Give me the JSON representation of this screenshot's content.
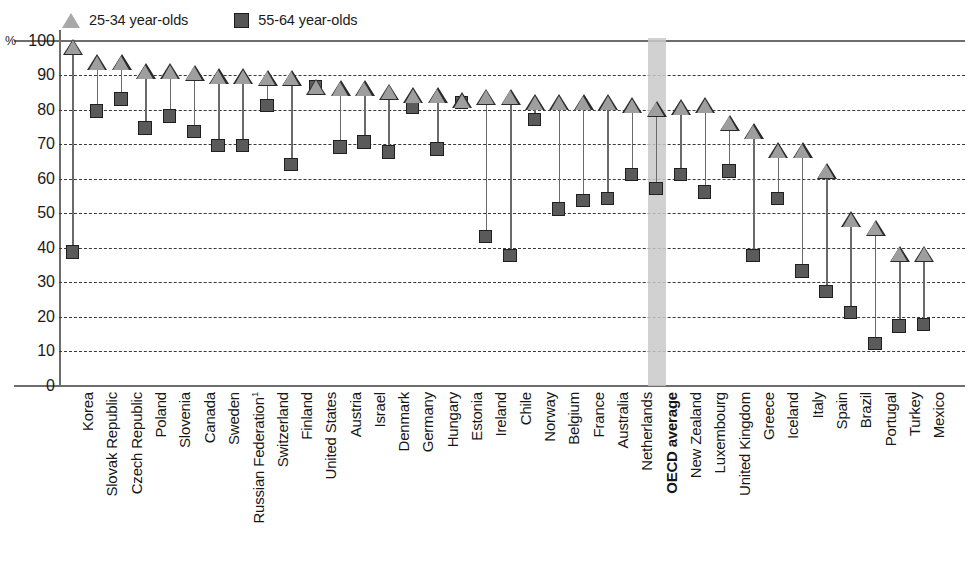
{
  "legend": {
    "items": [
      {
        "label": "25-34 year-olds",
        "marker": "triangle-icon",
        "color": "#9e9e9e"
      },
      {
        "label": "55-64 year-olds",
        "marker": "square-icon",
        "color": "#5a5a5a"
      }
    ]
  },
  "axis": {
    "unit_label": "%",
    "y_ticks": [
      "100",
      "90",
      "80",
      "70",
      "60",
      "50",
      "40",
      "30",
      "20",
      "10",
      "0"
    ]
  },
  "highlight": {
    "category": "OECD average",
    "color": "#c9c9c9"
  },
  "chart_data": {
    "type": "scatter",
    "title": "",
    "subtitle": "",
    "xlabel": "",
    "ylabel": "%",
    "ylim": [
      0,
      100
    ],
    "y_ticks": [
      0,
      10,
      20,
      30,
      40,
      50,
      60,
      70,
      80,
      90,
      100
    ],
    "grid": true,
    "legend_position": "top-left",
    "highlighted_category": "OECD average",
    "categories": [
      "Korea",
      "Slovak Republic",
      "Czech Republic",
      "Poland",
      "Slovenia",
      "Canada",
      "Sweden",
      "Russian Federation¹",
      "Switzerland",
      "Finland",
      "United States",
      "Austria",
      "Israel",
      "Denmark",
      "Germany",
      "Hungary",
      "Estonia",
      "Ireland",
      "Chile",
      "Norway",
      "Belgium",
      "France",
      "Australia",
      "Netherlands",
      "OECD average",
      "New Zealand",
      "Luxembourg",
      "United Kingdom",
      "Greece",
      "Iceland",
      "Italy",
      "Spain",
      "Brazil",
      "Portugal",
      "Turkey",
      "Mexico"
    ],
    "series": [
      {
        "name": "25-34 year-olds",
        "marker": "triangle",
        "color": "#9e9e9e",
        "values": [
          98,
          93.5,
          93.5,
          91,
          91,
          90.5,
          89.5,
          89.5,
          89,
          89,
          86.5,
          86,
          86,
          85,
          84,
          84,
          82.5,
          83.5,
          83.5,
          82,
          82,
          82,
          82,
          81,
          80,
          80.5,
          81,
          76,
          73.5,
          68,
          68,
          62,
          48,
          45.5,
          38,
          38
        ]
      },
      {
        "name": "55-64 year-olds",
        "marker": "square",
        "color": "#5a5a5a",
        "values": [
          38.5,
          79.5,
          83,
          74.5,
          78,
          73.5,
          69.5,
          69.5,
          81,
          64,
          86.5,
          69,
          70.5,
          67.5,
          80.5,
          68.5,
          82,
          43,
          37.5,
          77,
          51,
          53.5,
          54,
          61,
          57,
          61,
          56,
          62,
          37.5,
          54,
          33,
          27,
          21,
          12,
          17,
          17.5
        ]
      }
    ]
  }
}
